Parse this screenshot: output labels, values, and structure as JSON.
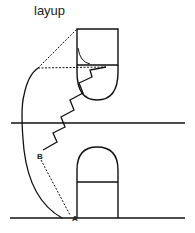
{
  "title": "layup",
  "labels": {
    "point_a": "A",
    "point_b": "B"
  },
  "colors": {
    "stroke": "#111111",
    "background": "#ffffff"
  }
}
